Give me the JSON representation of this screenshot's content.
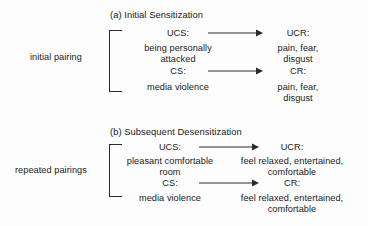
{
  "figure": {
    "kind": "classical-conditioning-diagram",
    "ink_color": "#1a1a1a",
    "background_color": "#fdfdfd",
    "arrow_color": "#2b2b2b"
  },
  "panels": [
    {
      "id": "a",
      "title": "(a) Initial Sensitization",
      "pairing_label": "initial pairing",
      "rows": [
        {
          "stimulus_code": "UCS:",
          "stimulus_text": "being personally\nattacked",
          "stimulus_line1": "being personally",
          "stimulus_line2": "attacked",
          "response_code": "UCR:",
          "response_text": "pain, fear,\ndisgust",
          "response_line1": "pain, fear,",
          "response_line2": "disgust"
        },
        {
          "stimulus_code": "CS:",
          "stimulus_text": "media violence",
          "stimulus_line1": "media violence",
          "stimulus_line2": "",
          "response_code": "CR:",
          "response_text": "pain, fear,\ndisgust",
          "response_line1": "pain, fear,",
          "response_line2": "disgust"
        }
      ]
    },
    {
      "id": "b",
      "title": "(b) Subsequent Desensitization",
      "pairing_label": "repeated pairings",
      "rows": [
        {
          "stimulus_code": "UCS:",
          "stimulus_text": "pleasant comfortable\nroom",
          "stimulus_line1": "pleasant comfortable",
          "stimulus_line2": "room",
          "response_code": "UCR:",
          "response_text": "feel relaxed, entertained,\ncomfortable",
          "response_line1": "feel relaxed, entertained,",
          "response_line2": "comfortable"
        },
        {
          "stimulus_code": "CS:",
          "stimulus_text": "media violence",
          "stimulus_line1": "media violence",
          "stimulus_line2": "",
          "response_code": "CR:",
          "response_text": "feel relaxed, entertained,\ncomfortable",
          "response_line1": "feel relaxed, entertained,",
          "response_line2": "comfortable"
        }
      ]
    }
  ]
}
